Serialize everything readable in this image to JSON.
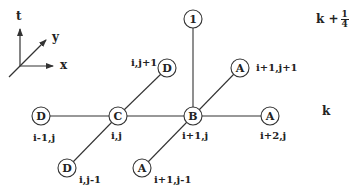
{
  "axes": {
    "t_label": "t",
    "y_label": "y",
    "x_label": "x"
  },
  "levels": {
    "upper": {
      "base": "k +",
      "numerator": "1",
      "denominator": "4"
    },
    "lower": "k"
  },
  "nodes": [
    {
      "id": "top",
      "letter": "1",
      "label": "",
      "x": 193,
      "y": 19
    },
    {
      "id": "d-i-jp1",
      "letter": "D",
      "label": "i,j+1",
      "x": 167,
      "y": 68
    },
    {
      "id": "a-ip1-jp1",
      "letter": "A",
      "label": "i+1,j+1",
      "x": 240,
      "y": 68
    },
    {
      "id": "d-im1-j",
      "letter": "D",
      "label": "i-1,j",
      "x": 41,
      "y": 116
    },
    {
      "id": "c-i-j",
      "letter": "C",
      "label": "i,j",
      "x": 118,
      "y": 116
    },
    {
      "id": "b-ip1-j",
      "letter": "B",
      "label": "i+1,j",
      "x": 193,
      "y": 116
    },
    {
      "id": "a-ip2-j",
      "letter": "A",
      "label": "i+2,j",
      "x": 270,
      "y": 116
    },
    {
      "id": "d-i-jm1",
      "letter": "D",
      "label": "i,j-1",
      "x": 67,
      "y": 168
    },
    {
      "id": "a-ip1-jm1",
      "letter": "A",
      "label": "i+1,j-1",
      "x": 142,
      "y": 168
    }
  ],
  "colors": {
    "stroke": "#333333",
    "text": "#222222",
    "background": "#ffffff"
  }
}
